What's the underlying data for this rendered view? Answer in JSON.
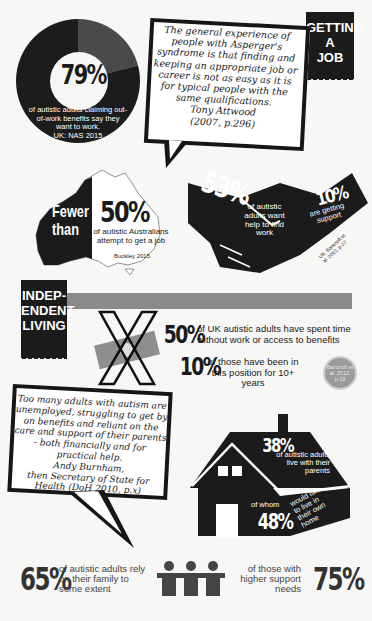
{
  "getting_a_job": {
    "ribbon": [
      "GETTING",
      "A",
      "JOB"
    ],
    "donut": {
      "value": "79%",
      "caption": "of autistic adults claiming out-of-work benefits say they want to work.",
      "source": "UK: NAS 2015"
    },
    "quote": {
      "text": "The general experience of people with Asperger's syndrome is that finding and keeping an appropriate job or career is not as easy as it is for typical people with the same qualifications.",
      "author": "Tony Attwood",
      "citation": "(2007, p.296)"
    },
    "australia": {
      "prefix": "Fewer than",
      "value": "50%",
      "caption": "of autistic Australians attempt to get a job",
      "source": "Buckley 2015"
    },
    "handshake": {
      "value_want": "53%",
      "caption_want": "of autistic adults want help to find work",
      "value_support": "10%",
      "caption_support": "are getting support",
      "source": "UK: Bancroft et al. 2012, p.27"
    }
  },
  "independent_living": {
    "ribbon": [
      "INDEP-",
      "ENDENT",
      "LIVING"
    ],
    "stat1": {
      "value": "50%",
      "caption": "of UK autistic adults have spent time without work or access to benefits"
    },
    "stat2": {
      "value": "10%",
      "caption": "of those have been in this position for 10+ years"
    },
    "badge": "Bancroft et al. 2012, p.19",
    "quote": {
      "text": "Too many adults with autism are unemployed, struggling to get by on benefits and reliant on the care and support of their parents - both financially and for practical help.",
      "author": "Andy Burnham,",
      "role": "then Secretary of State for Health",
      "citation": "(DoH 2010, p.x)"
    },
    "house": {
      "value_live": "38%",
      "caption_live": "of autistic adults live with their parents",
      "of_whom": "of whom",
      "value_like": "48%",
      "caption_like": "would like to live in their own home"
    },
    "family": {
      "value": "65%",
      "caption": "of autistic adults rely on their family to some extent",
      "value_high": "75%",
      "caption_high": "of those with higher support needs"
    }
  },
  "colors": {
    "ink": "#1b1b1b",
    "grey_bar": "#8a8a8a",
    "badge": "#9b9b9b",
    "paper": "#f7f7f5"
  }
}
